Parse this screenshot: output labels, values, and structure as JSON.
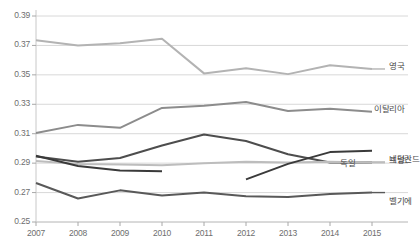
{
  "chart_data": {
    "type": "line",
    "title": "",
    "xlabel": "",
    "ylabel": "",
    "x": [
      2007,
      2008,
      2009,
      2010,
      2011,
      2012,
      2013,
      2014,
      2015
    ],
    "categories": [
      "2007",
      "2008",
      "2009",
      "2010",
      "2011",
      "2012",
      "2013",
      "2014",
      "2015"
    ],
    "ylim": [
      0.25,
      0.39
    ],
    "ytick_labels": [
      "0.39",
      "0.37",
      "0.35",
      "0.33",
      "0.31",
      "0.29",
      "0.27",
      "0.25"
    ],
    "ytick_values": [
      0.39,
      0.37,
      0.35,
      0.33,
      0.31,
      0.29,
      0.27,
      0.25
    ],
    "grid": true,
    "legend_position": "right-of-plot",
    "series": [
      {
        "name": "영국",
        "color": "#b3b3b3",
        "values": [
          0.3735,
          0.37,
          0.3715,
          0.3745,
          0.351,
          0.3545,
          0.3505,
          0.3565,
          0.354
        ]
      },
      {
        "name": "이탈리아",
        "color": "#8c8c8c",
        "values": [
          0.3105,
          0.316,
          0.314,
          0.3275,
          0.329,
          0.3315,
          0.3255,
          0.327,
          0.325
        ]
      },
      {
        "name": "네덜란드",
        "color": "#4d4d4d",
        "values": [
          0.2945,
          0.291,
          0.2935,
          0.302,
          0.3095,
          0.305,
          0.296,
          0.2905,
          0.2905
        ]
      },
      {
        "name": "프랑스",
        "color": "#bdbdbd",
        "values": [
          0.2915,
          0.2895,
          0.289,
          0.2885,
          0.29,
          0.291,
          0.2905,
          0.291,
          0.2905
        ]
      },
      {
        "name": "독일",
        "color": "#3a3a3a",
        "values": [
          0.295,
          0.288,
          0.285,
          0.2845,
          null,
          0.279,
          0.2895,
          0.2975,
          0.2985
        ]
      },
      {
        "name": "벨기에",
        "color": "#595959",
        "values": [
          0.2765,
          0.266,
          0.2715,
          0.268,
          0.27,
          0.2675,
          0.267,
          0.269,
          0.27
        ]
      }
    ]
  },
  "axis": {
    "y_labels": [
      "0.39",
      "0.37",
      "0.35",
      "0.33",
      "0.31",
      "0.29",
      "0.27",
      "0.25"
    ],
    "x_labels": [
      "2007",
      "2008",
      "2009",
      "2010",
      "2011",
      "2012",
      "2013",
      "2014",
      "2015"
    ]
  },
  "legend": {
    "items": [
      {
        "label": "영국"
      },
      {
        "label": "이탈리아"
      },
      {
        "label": "네덜란드"
      },
      {
        "label": "프랑스"
      },
      {
        "label": "독일"
      },
      {
        "label": "벨기에"
      }
    ]
  }
}
